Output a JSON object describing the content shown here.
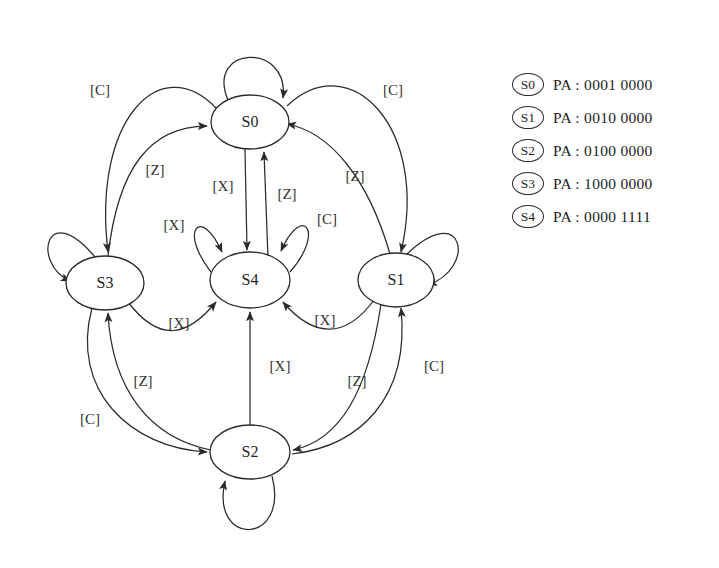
{
  "figure": {
    "type": "state-transition-diagram",
    "background": "#ffffff",
    "stroke_color": "#2b2b2b",
    "text_color": "#1f1f1f"
  },
  "states": [
    {
      "id": "S0",
      "label": "S0",
      "cx": 250,
      "cy": 122,
      "rx": 39,
      "ry": 27
    },
    {
      "id": "S3",
      "label": "S3",
      "cx": 105,
      "cy": 283,
      "rx": 39,
      "ry": 27
    },
    {
      "id": "S4",
      "label": "S4",
      "cx": 250,
      "cy": 280,
      "rx": 40,
      "ry": 28
    },
    {
      "id": "S1",
      "label": "S1",
      "cx": 396,
      "cy": 280,
      "rx": 38,
      "ry": 27
    },
    {
      "id": "S2",
      "label": "S2",
      "cx": 250,
      "cy": 452,
      "rx": 40,
      "ry": 27
    }
  ],
  "edge_labels": [
    {
      "id": "s0-s3-c",
      "text": "[C]",
      "x": 100,
      "y": 92
    },
    {
      "id": "s3-s0-z",
      "text": "[Z]",
      "x": 155,
      "y": 172
    },
    {
      "id": "s0-s1-c",
      "text": "[C]",
      "x": 393,
      "y": 92
    },
    {
      "id": "s1-s0-z",
      "text": "[Z]",
      "x": 355,
      "y": 178
    },
    {
      "id": "s0-s4-x",
      "text": "[X]",
      "x": 223,
      "y": 188
    },
    {
      "id": "s4-s0-z",
      "text": "[Z]",
      "x": 287,
      "y": 196
    },
    {
      "id": "s4-self-x",
      "text": "[X]",
      "x": 174,
      "y": 227
    },
    {
      "id": "s4-self-c",
      "text": "[C]",
      "x": 327,
      "y": 221
    },
    {
      "id": "s3-s4-x",
      "text": "[X]",
      "x": 179,
      "y": 325
    },
    {
      "id": "s1-s4-x",
      "text": "[X]",
      "x": 325,
      "y": 322
    },
    {
      "id": "s2-s4-x",
      "text": "[X]",
      "x": 280,
      "y": 368
    },
    {
      "id": "s2-s3-z",
      "text": "[Z]",
      "x": 143,
      "y": 383
    },
    {
      "id": "s3-s2-c",
      "text": "[C]",
      "x": 90,
      "y": 421
    },
    {
      "id": "s1-s2-z",
      "text": "[Z]",
      "x": 357,
      "y": 383
    },
    {
      "id": "s2-s1-c",
      "text": "[C]",
      "x": 434,
      "y": 368
    }
  ],
  "transitions": [
    {
      "from": "S0",
      "to": "S3",
      "label": "[C]"
    },
    {
      "from": "S3",
      "to": "S0",
      "label": "[Z]"
    },
    {
      "from": "S0",
      "to": "S1",
      "label": "[C]"
    },
    {
      "from": "S1",
      "to": "S0",
      "label": "[Z]"
    },
    {
      "from": "S0",
      "to": "S4",
      "label": "[X]"
    },
    {
      "from": "S4",
      "to": "S0",
      "label": "[Z]"
    },
    {
      "from": "S4",
      "to": "S4",
      "label": "[X]"
    },
    {
      "from": "S4",
      "to": "S4",
      "label": "[C]"
    },
    {
      "from": "S3",
      "to": "S4",
      "label": "[X]"
    },
    {
      "from": "S1",
      "to": "S4",
      "label": "[X]"
    },
    {
      "from": "S2",
      "to": "S4",
      "label": "[X]"
    },
    {
      "from": "S2",
      "to": "S3",
      "label": "[Z]"
    },
    {
      "from": "S3",
      "to": "S2",
      "label": "[C]"
    },
    {
      "from": "S1",
      "to": "S2",
      "label": "[Z]"
    },
    {
      "from": "S2",
      "to": "S1",
      "label": "[C]"
    },
    {
      "from": "S0",
      "to": "S0",
      "label": ""
    },
    {
      "from": "S3",
      "to": "S3",
      "label": ""
    },
    {
      "from": "S1",
      "to": "S1",
      "label": ""
    },
    {
      "from": "S2",
      "to": "S2",
      "label": ""
    }
  ],
  "legend": {
    "rows": [
      {
        "badge": "S0",
        "text": "PA : 0001 0000"
      },
      {
        "badge": "S1",
        "text": "PA : 0010 0000"
      },
      {
        "badge": "S2",
        "text": "PA : 0100 0000"
      },
      {
        "badge": "S3",
        "text": "PA : 1000 0000"
      },
      {
        "badge": "S4",
        "text": "PA : 0000 1111"
      }
    ]
  }
}
